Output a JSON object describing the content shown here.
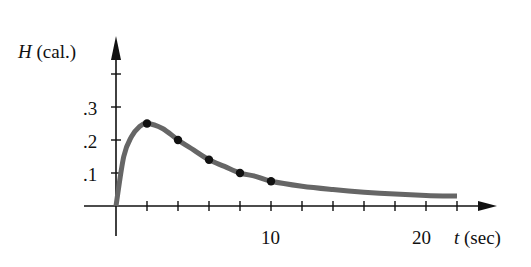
{
  "chart_data": {
    "type": "line",
    "title": "",
    "xlabel": "t (sec)",
    "ylabel": "H (cal.)",
    "xlabel_var": "t",
    "xlabel_unit": "(sec)",
    "ylabel_var": "H",
    "ylabel_unit": "(cal.)",
    "xlim": [
      0,
      24
    ],
    "ylim": [
      0,
      0.45
    ],
    "x_ticks": [
      2,
      4,
      6,
      8,
      10,
      12,
      14,
      16,
      18,
      20,
      22
    ],
    "x_tick_labels": [
      {
        "value": 10,
        "label": "10"
      },
      {
        "value": 20,
        "label": "20"
      }
    ],
    "y_ticks": [
      0.1,
      0.2,
      0.3,
      0.4
    ],
    "y_tick_labels": [
      {
        "value": 0.1,
        "label": ".1"
      },
      {
        "value": 0.2,
        "label": ".2"
      },
      {
        "value": 0.3,
        "label": ".3"
      }
    ],
    "grid": false,
    "legend": null,
    "series": [
      {
        "name": "H(t) curve",
        "style": "smooth",
        "color": "#666666",
        "x": [
          0,
          0.5,
          1,
          1.5,
          2,
          3,
          4,
          5,
          6,
          7,
          8,
          9,
          10,
          12,
          14,
          16,
          18,
          20,
          22
        ],
        "values": [
          0,
          0.15,
          0.21,
          0.24,
          0.25,
          0.235,
          0.2,
          0.17,
          0.14,
          0.12,
          0.1,
          0.09,
          0.075,
          0.06,
          0.05,
          0.042,
          0.036,
          0.032,
          0.03
        ]
      },
      {
        "name": "measured points",
        "style": "markers",
        "color": "#111111",
        "x": [
          2,
          4,
          6,
          8,
          10
        ],
        "values": [
          0.25,
          0.2,
          0.14,
          0.1,
          0.075
        ]
      }
    ]
  },
  "labels": {
    "ylabel_var": "H",
    "ylabel_unit": "(cal.)",
    "xlabel_var": "t",
    "xlabel_unit": "(sec)",
    "ytick_1": ".1",
    "ytick_2": ".2",
    "ytick_3": ".3",
    "xtick_10": "10",
    "xtick_20": "20"
  }
}
